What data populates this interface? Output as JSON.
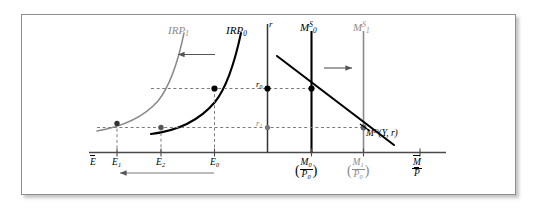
{
  "figure": {
    "type": "economics-two-panel-diagram",
    "colors": {
      "curve_initial": "#000000",
      "curve_shifted": "#8a8a8a",
      "axis": "#4a4a4a",
      "dashed_guide": "#8a8a8a",
      "frame_border": "#8e8e8e",
      "background": "#ffffff"
    }
  },
  "labels": {
    "irp_shifted": {
      "base": "IRP",
      "sub": "1"
    },
    "irp_initial": {
      "base": "IRP",
      "sub": "0"
    },
    "money_supply_initial": {
      "base": "M",
      "sub": "0",
      "sup": "S"
    },
    "money_supply_shifted": {
      "base": "M",
      "sub": "1",
      "sup": "S"
    },
    "interest_axis": "r",
    "rate_initial": {
      "base": "r",
      "sub": "0"
    },
    "rate_final": {
      "base": "r",
      "sub": "1"
    },
    "money_demand": {
      "base": "M",
      "sup": "D",
      "args": "(Y, r)"
    }
  },
  "exchange_axis": {
    "axis_label": {
      "base": "E",
      "overbar": true
    },
    "ticks": [
      {
        "id": "E1",
        "base": "E",
        "sub": "1"
      },
      {
        "id": "E2",
        "base": "E",
        "sub": "2"
      },
      {
        "id": "E0",
        "base": "E",
        "sub": "0"
      }
    ],
    "arrow_direction": "left"
  },
  "money_axis": {
    "axis_label": {
      "numerator": "M",
      "denominator": "P",
      "overbar": true
    },
    "ticks": [
      {
        "id": "M0P0",
        "numerator": "M",
        "numerator_sub": "0",
        "denominator": "P",
        "denominator_sub": "0",
        "parenthesized": true
      },
      {
        "id": "M1P0",
        "numerator": "M",
        "numerator_sub": "1",
        "denominator": "P",
        "denominator_sub": "0",
        "parenthesized": true
      }
    ]
  },
  "arrows": [
    {
      "id": "irp-shift-arrow",
      "direction": "left",
      "meaning": "IRP curve shifts left"
    },
    {
      "id": "money-supply-shift-arrow",
      "direction": "right",
      "meaning": "Money supply shifts right"
    },
    {
      "id": "exchange-rate-arrow",
      "direction": "left",
      "meaning": "Exchange rate falls from E0 toward E1"
    }
  ],
  "equilibria": [
    {
      "id": "point-A",
      "curve": "IRP0",
      "exchange": "E0",
      "rate": "r0"
    },
    {
      "id": "point-B",
      "curve": "IRP0",
      "exchange": "E2",
      "rate": "r1"
    },
    {
      "id": "point-C",
      "curve": "IRP1",
      "exchange": "E1",
      "rate": "r1"
    },
    {
      "id": "point-D",
      "curve": "money-market",
      "supply": "M0S",
      "rate": "r0"
    },
    {
      "id": "point-E",
      "curve": "money-market",
      "supply": "M1S",
      "rate": "r1"
    }
  ]
}
